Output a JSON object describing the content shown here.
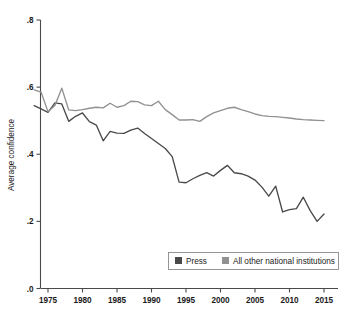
{
  "chart_data": {
    "type": "line",
    "title": "",
    "xlabel": "",
    "ylabel": "Average confidence",
    "xlim": [
      1973,
      2016
    ],
    "ylim": [
      0.0,
      0.8
    ],
    "grid": false,
    "legend_position": "bottom-right",
    "xticks": [
      1975,
      1980,
      1985,
      1990,
      1995,
      2000,
      2005,
      2010,
      2015
    ],
    "xtick_labels": [
      "1975",
      "1980",
      "1985",
      "1990",
      "1995",
      "2000",
      "2005",
      "2010",
      "2015"
    ],
    "yticks": [
      0.0,
      0.2,
      0.4,
      0.6,
      0.8
    ],
    "ytick_labels": [
      ".0",
      ".2",
      ".4",
      ".6",
      ".8"
    ],
    "x": [
      1973,
      1974,
      1975,
      1976,
      1977,
      1978,
      1979,
      1980,
      1981,
      1982,
      1983,
      1984,
      1985,
      1986,
      1987,
      1988,
      1989,
      1990,
      1991,
      1992,
      1993,
      1994,
      1995,
      1996,
      1997,
      1998,
      1999,
      2000,
      2001,
      2002,
      2003,
      2004,
      2005,
      2006,
      2007,
      2008,
      2009,
      2010,
      2011,
      2012,
      2013,
      2014,
      2015
    ],
    "series": [
      {
        "name": "Press",
        "color": "#4a4a4a",
        "values": [
          0.545,
          0.535,
          0.525,
          0.553,
          0.55,
          0.498,
          0.513,
          0.523,
          0.497,
          0.487,
          0.44,
          0.468,
          0.463,
          0.462,
          0.472,
          0.478,
          0.462,
          0.447,
          0.432,
          0.417,
          0.393,
          0.317,
          0.315,
          0.327,
          0.337,
          0.345,
          0.335,
          0.352,
          0.367,
          0.345,
          0.342,
          0.335,
          0.323,
          0.302,
          0.275,
          0.305,
          0.228,
          0.235,
          0.238,
          0.272,
          0.232,
          0.2,
          0.222
        ]
      },
      {
        "name": "All other national institutions",
        "color": "#919191",
        "values": [
          0.592,
          0.585,
          0.527,
          0.545,
          0.597,
          0.532,
          0.53,
          0.533,
          0.537,
          0.54,
          0.538,
          0.552,
          0.54,
          0.545,
          0.558,
          0.557,
          0.547,
          0.545,
          0.558,
          0.533,
          0.518,
          0.502,
          0.502,
          0.503,
          0.498,
          0.512,
          0.523,
          0.53,
          0.537,
          0.54,
          0.533,
          0.527,
          0.52,
          0.515,
          0.513,
          0.512,
          0.51,
          0.508,
          0.505,
          0.503,
          0.502,
          0.501,
          0.5
        ]
      }
    ]
  },
  "legend": {
    "items": [
      {
        "label": "Press",
        "swatch": "#4a4a4a"
      },
      {
        "label": "All other national institutions",
        "swatch": "#919191"
      }
    ]
  },
  "axes": {
    "y_title": "Average confidence"
  }
}
